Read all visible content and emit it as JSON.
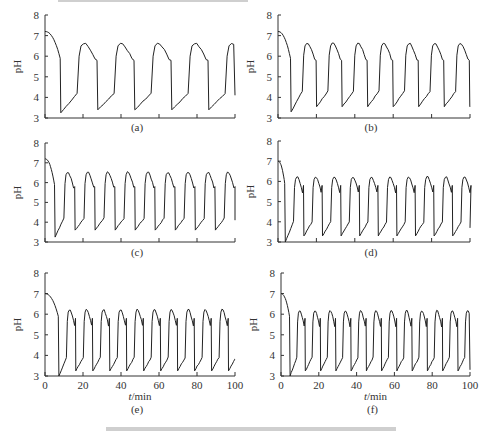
{
  "figure": {
    "top_caption_fragment": "",
    "bottom_caption_fragment": "图"
  },
  "chart_data": [
    {
      "panel": "(a)",
      "type": "line",
      "title": "",
      "xlabel": "",
      "ylabel": "pH",
      "ylim": [
        3,
        8
      ],
      "xlim": [
        0,
        100
      ],
      "yticks": [
        "3",
        "4",
        "5",
        "6",
        "7",
        "8"
      ],
      "xticks_shown": false,
      "grid": false,
      "initial_pH": 7.2,
      "peaks": 4,
      "peak_pH": 6.6,
      "trough_pH": 3.4,
      "pre_rise_pH": 4.2,
      "first_trough_pH": 3.25,
      "cycle_period_min": 20.5,
      "first_drop_min": 8,
      "end_pH": 4.1,
      "series": [
        {
          "name": "pH",
          "x": [
            0,
            8,
            8.5,
            19,
            20,
            22,
            27,
            28.5,
            29,
            39.5,
            41,
            43,
            48,
            49,
            49.5,
            60,
            61.5,
            63.5,
            68.5,
            70,
            70.5,
            80.5,
            82,
            84,
            89,
            90.5,
            91,
            100
          ],
          "y": [
            7.2,
            6.0,
            3.25,
            4.2,
            6.4,
            6.6,
            6.4,
            5.9,
            3.45,
            4.2,
            6.45,
            6.6,
            6.4,
            5.9,
            3.45,
            4.2,
            6.45,
            6.6,
            6.4,
            5.9,
            3.5,
            4.2,
            6.45,
            6.6,
            6.4,
            5.9,
            3.45,
            4.1
          ]
        }
      ]
    },
    {
      "panel": "(b)",
      "type": "line",
      "title": "",
      "xlabel": "",
      "ylabel": "pH",
      "ylim": [
        3,
        8
      ],
      "xlim": [
        0,
        100
      ],
      "yticks": [
        "3",
        "4",
        "5",
        "6",
        "7",
        "8"
      ],
      "xticks_shown": false,
      "grid": false,
      "initial_pH": 7.2,
      "peaks": 7,
      "peak_pH": 6.6,
      "trough_pH": 3.55,
      "pre_rise_pH": 4.3,
      "first_trough_pH": 3.3,
      "cycle_period_min": 14,
      "first_drop_min": 6.5,
      "end_pH": 6.6
    },
    {
      "panel": "(c)",
      "type": "line",
      "title": "",
      "xlabel": "",
      "ylabel": "pH",
      "ylim": [
        3,
        8
      ],
      "xlim": [
        0,
        100
      ],
      "yticks": [
        "3",
        "4",
        "5",
        "6",
        "7",
        "8"
      ],
      "xticks_shown": false,
      "grid": false,
      "initial_pH": 7.2,
      "peaks": 8,
      "peak_pH": 6.5,
      "trough_pH": 3.6,
      "pre_rise_pH": 4.2,
      "first_trough_pH": 3.25,
      "cycle_period_min": 11.1,
      "first_drop_min": 5,
      "end_pH": 4.1
    },
    {
      "panel": "(d)",
      "type": "line",
      "title": "",
      "xlabel": "",
      "ylabel": "pH",
      "ylim": [
        3,
        8
      ],
      "xlim": [
        0,
        100
      ],
      "yticks": [
        "3",
        "4",
        "5",
        "6",
        "7",
        "8"
      ],
      "xticks_shown": false,
      "grid": false,
      "initial_pH": 7.0,
      "peaks": 9,
      "peak_pH": 6.2,
      "trough_pH": 3.3,
      "pre_rise_pH": 4.0,
      "first_trough_pH": 3.0,
      "cycle_period_min": 10.2,
      "first_drop_min": 3.5,
      "end_pH": 3.7
    },
    {
      "panel": "(e)",
      "type": "line",
      "title": "",
      "xlabel": "t/min",
      "ylabel": "pH",
      "ylim": [
        3,
        8
      ],
      "xlim": [
        0,
        100
      ],
      "xticks": [
        "0",
        "20",
        "40",
        "60",
        "80",
        "100"
      ],
      "yticks": [
        "3",
        "4",
        "5",
        "6",
        "7",
        "8"
      ],
      "xticks_shown": true,
      "grid": false,
      "initial_pH": 7.0,
      "peaks": 10,
      "peak_pH": 6.2,
      "trough_pH": 3.25,
      "pre_rise_pH": 3.9,
      "first_trough_pH": 3.0,
      "cycle_period_min": 9.4,
      "first_drop_min": 7,
      "end_pH": 6.1
    },
    {
      "panel": "(f)",
      "type": "line",
      "title": "",
      "xlabel": "t/min",
      "ylabel": "pH",
      "ylim": [
        3,
        8
      ],
      "xlim": [
        0,
        100
      ],
      "xticks": [
        "0",
        "20",
        "40",
        "60",
        "80",
        "100"
      ],
      "yticks": [
        "3",
        "4",
        "5",
        "6",
        "7",
        "8"
      ],
      "xticks_shown": true,
      "grid": false,
      "initial_pH": 7.0,
      "peaks": 11,
      "peak_pH": 6.15,
      "trough_pH": 3.25,
      "pre_rise_pH": 3.9,
      "first_trough_pH": 3.0,
      "cycle_period_min": 8.5,
      "first_drop_min": 4.5,
      "end_pH": 3.3
    }
  ],
  "layout": {
    "panels": [
      {
        "id": "a",
        "x0": 45,
        "x1": 235,
        "y8": 15,
        "y3": 118,
        "label_y": 131
      },
      {
        "id": "b",
        "x0": 278,
        "x1": 470,
        "y8": 15,
        "y3": 118,
        "label_y": 131
      },
      {
        "id": "c",
        "x0": 45,
        "x1": 235,
        "y8": 143,
        "y3": 242,
        "label_y": 256
      },
      {
        "id": "d",
        "x0": 278,
        "x1": 470,
        "y8": 141,
        "y3": 242,
        "label_y": 256
      },
      {
        "id": "e",
        "x0": 45,
        "x1": 235,
        "y8": 273,
        "y3": 376,
        "label_y": 413
      },
      {
        "id": "f",
        "x0": 281,
        "x1": 470,
        "y8": 273,
        "y3": 376,
        "label_y": 413
      }
    ]
  }
}
